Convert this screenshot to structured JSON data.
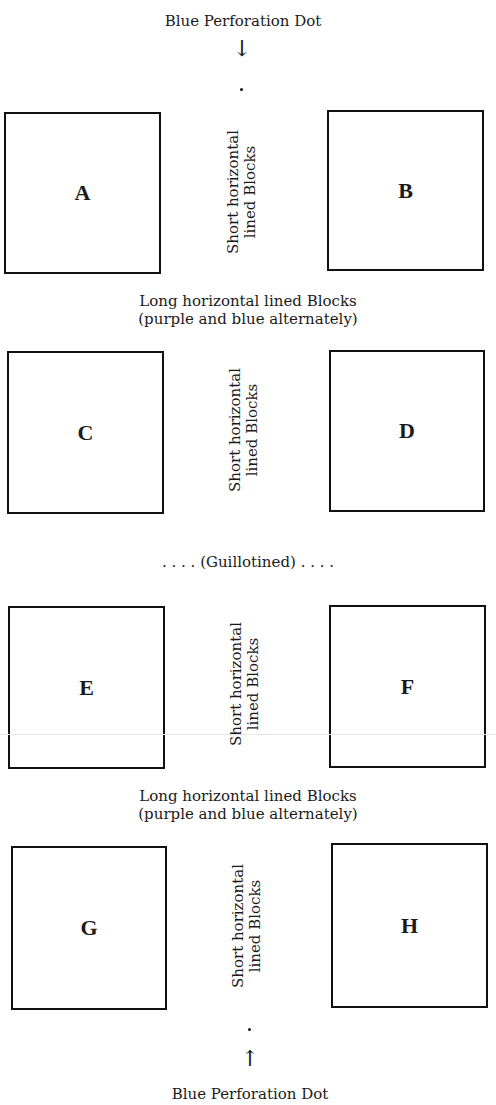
{
  "diagram": {
    "top": {
      "label": "Blue Perforation Dot",
      "arrow": "↓"
    },
    "bottom": {
      "label": "Blue Perforation Dot",
      "arrow": "↑"
    },
    "blocks": [
      {
        "letter": "A"
      },
      {
        "letter": "B"
      },
      {
        "letter": "C"
      },
      {
        "letter": "D"
      },
      {
        "letter": "E"
      },
      {
        "letter": "F"
      },
      {
        "letter": "G"
      },
      {
        "letter": "H"
      }
    ],
    "short_blocks_label": {
      "line1": "Short horizontal",
      "line2": "lined Blocks"
    },
    "long_blocks_label": {
      "line1": "Long horizontal lined Blocks",
      "line2": "(purple and blue alternately)"
    },
    "guillotined_label": ". . . . (Guillotined) . . . ."
  }
}
